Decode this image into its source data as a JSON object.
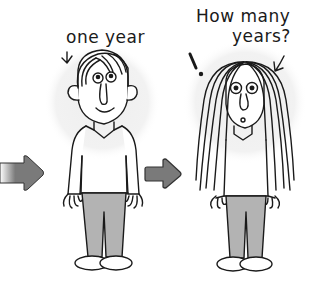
{
  "illustration": {
    "left_caption": "one year",
    "right_caption_line1": "How many",
    "right_caption_line2": "years?",
    "exclamation": "!",
    "colors": {
      "outline": "#1a1a1a",
      "halo": "#efefef",
      "pants": "#b3b3b3",
      "arrow": "#7a7a7a",
      "arrow_outline": "#333333",
      "background": "#ffffff"
    }
  }
}
